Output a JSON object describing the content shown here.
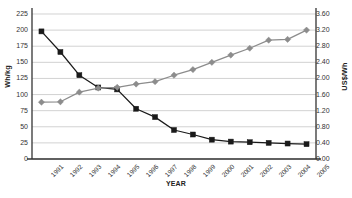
{
  "chart_data": {
    "type": "line",
    "title": "",
    "xlabel": "YEAR",
    "categories": [
      1991,
      1992,
      1993,
      1994,
      1995,
      1996,
      1997,
      1998,
      1999,
      2000,
      2001,
      2002,
      2003,
      2004,
      2005
    ],
    "series": [
      {
        "name": "Energy density",
        "axis": "left",
        "unit": "Wh/kg",
        "color": "#1a1a1a",
        "marker": "square",
        "values": [
          198,
          166,
          130,
          111,
          108,
          78,
          65,
          45,
          38,
          30,
          27,
          26,
          25,
          24,
          23
        ]
      },
      {
        "name": "Cost",
        "axis": "right",
        "unit": "US$/Wh",
        "color": "#8c8c8c",
        "marker": "diamond",
        "values": [
          1.41,
          1.42,
          1.66,
          1.76,
          1.78,
          1.86,
          1.92,
          2.08,
          2.22,
          2.4,
          2.58,
          2.75,
          2.95,
          2.97,
          3.2
        ]
      }
    ],
    "left_axis": {
      "label": "Wh/kg",
      "min": 0,
      "max": 225,
      "step": 25,
      "ticks": [
        "0",
        "25",
        "50",
        "75",
        "100",
        "125",
        "150",
        "175",
        "200",
        "225"
      ]
    },
    "right_axis": {
      "label": "US$/Wh",
      "min": 0.0,
      "max": 3.6,
      "step": 0.4,
      "ticks": [
        "0.00",
        "0.40",
        "0.80",
        "1.20",
        "1.60",
        "2.00",
        "2.40",
        "2.80",
        "3.20",
        "3.60"
      ]
    },
    "xticks": [
      "1991",
      "1992",
      "1993",
      "1994",
      "1995",
      "1996",
      "1997",
      "1998",
      "1999",
      "2000",
      "2001",
      "2002",
      "2003",
      "2004",
      "2005"
    ],
    "grid": true,
    "legend": "none"
  }
}
